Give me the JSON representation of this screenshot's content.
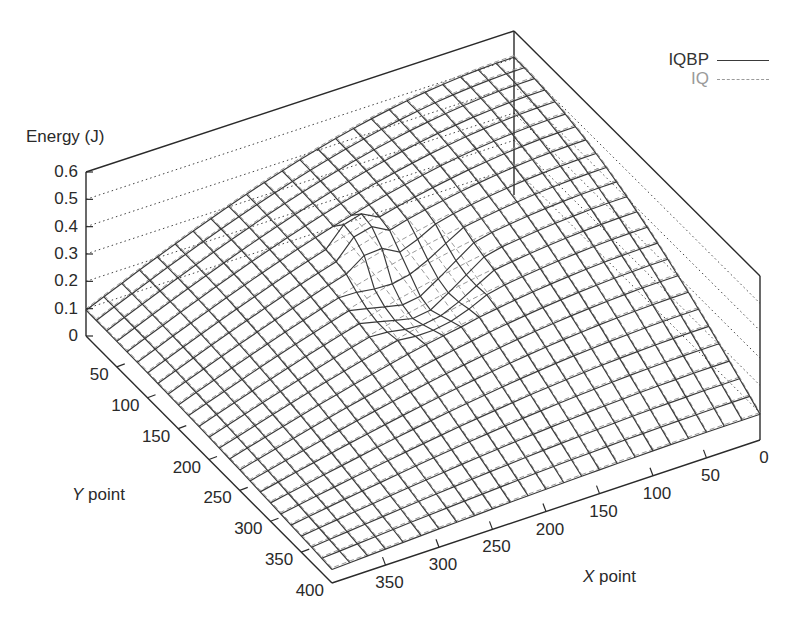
{
  "chart_data": {
    "type": "surface3d",
    "title": "",
    "zlabel": "Energy (J)",
    "xlabel": "X point",
    "ylabel": "Y point",
    "zlim": [
      0,
      0.6
    ],
    "xlim": [
      0,
      400
    ],
    "ylim": [
      0,
      400
    ],
    "z_ticks": [
      "0",
      "0.1",
      "0.2",
      "0.3",
      "0.4",
      "0.5",
      "0.6"
    ],
    "x_ticks": [
      "0",
      "50",
      "100",
      "150",
      "200",
      "250",
      "300",
      "350"
    ],
    "y_ticks": [
      "50",
      "100",
      "150",
      "200",
      "250",
      "300",
      "350",
      "400"
    ],
    "grid": "dotted z-gridlines on back walls",
    "legend": {
      "position": "top-right",
      "entries": [
        {
          "name": "IQBP",
          "style": "solid",
          "color": "#3a3a3a"
        },
        {
          "name": "IQ",
          "style": "dashed",
          "color": "#9a9a9a"
        }
      ]
    },
    "series": [
      {
        "name": "IQBP",
        "description": "Dome-shaped energy surface, peak ~0.5 J near X≈0,Y≈0 back corner, declining to ~0.05 J at far edges; pronounced dip/spike artifact near the center (X≈200,Y≈200)."
      },
      {
        "name": "IQ",
        "description": "Smooth dome-shaped energy surface closely following IQBP, peak ~0.5 J, without the central spike."
      }
    ],
    "approx_surface_grid": {
      "x": [
        0,
        50,
        100,
        150,
        200,
        250,
        300,
        350,
        400
      ],
      "y": [
        0,
        50,
        100,
        150,
        200,
        250,
        300,
        350,
        400
      ],
      "IQBP_z_rows_by_y": [
        [
          0.5,
          0.48,
          0.44,
          0.38,
          0.3,
          0.22,
          0.15,
          0.09,
          0.05
        ],
        [
          0.48,
          0.46,
          0.42,
          0.36,
          0.29,
          0.21,
          0.14,
          0.09,
          0.05
        ],
        [
          0.44,
          0.42,
          0.38,
          0.33,
          0.27,
          0.2,
          0.13,
          0.08,
          0.05
        ],
        [
          0.38,
          0.36,
          0.33,
          0.29,
          0.24,
          0.18,
          0.12,
          0.07,
          0.04
        ],
        [
          0.3,
          0.29,
          0.27,
          0.24,
          0.12,
          0.14,
          0.1,
          0.06,
          0.04
        ],
        [
          0.22,
          0.21,
          0.2,
          0.18,
          0.14,
          0.11,
          0.08,
          0.05,
          0.03
        ],
        [
          0.15,
          0.14,
          0.13,
          0.12,
          0.1,
          0.08,
          0.06,
          0.04,
          0.03
        ],
        [
          0.09,
          0.09,
          0.08,
          0.07,
          0.06,
          0.05,
          0.04,
          0.03,
          0.02
        ],
        [
          0.05,
          0.05,
          0.05,
          0.04,
          0.04,
          0.03,
          0.03,
          0.02,
          0.02
        ]
      ]
    }
  },
  "labels": {
    "zlabel": "Energy (J)",
    "xlabel_italic": "X",
    "xlabel_rest": " point",
    "ylabel_italic": "Y",
    "ylabel_rest": " point"
  },
  "colors": {
    "axis": "#2a2a2a",
    "iqbp": "#3a3a3a",
    "iq": "#9a9a9a",
    "grid": "#444444"
  }
}
